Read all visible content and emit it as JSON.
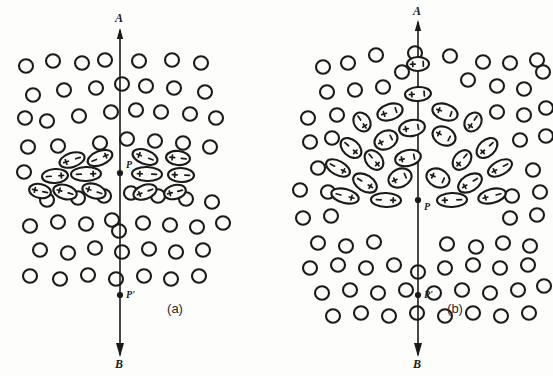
{
  "figure": {
    "background_color": "#fdfdfb",
    "ink_color": "#1a1a1a",
    "width": 553,
    "height": 376
  },
  "panels": [
    {
      "id": "a",
      "caption": "(a)",
      "caption_x": 175,
      "caption_y": 313,
      "axis": {
        "x": 120,
        "top_y": 30,
        "bottom_y": 355,
        "top_label": "A",
        "top_label_x": 119,
        "top_label_y": 22,
        "bottom_label": "B",
        "bottom_label_x": 119,
        "bottom_label_y": 368
      },
      "points": [
        {
          "name": "P",
          "label": "P",
          "x": 120,
          "y": 173,
          "label_x": 126,
          "label_y": 168
        },
        {
          "name": "P'",
          "label": "P'",
          "x": 120,
          "y": 295,
          "label_x": 126,
          "label_y": 298
        }
      ],
      "circle_radius": 7,
      "circles": [
        [
          26,
          66
        ],
        [
          53,
          61
        ],
        [
          82,
          63
        ],
        [
          105,
          60
        ],
        [
          139,
          61
        ],
        [
          172,
          60
        ],
        [
          201,
          63
        ],
        [
          33,
          95
        ],
        [
          64,
          90
        ],
        [
          96,
          88
        ],
        [
          122,
          84
        ],
        [
          146,
          86
        ],
        [
          174,
          88
        ],
        [
          205,
          92
        ],
        [
          47,
          121
        ],
        [
          79,
          116
        ],
        [
          111,
          112
        ],
        [
          136,
          110
        ],
        [
          161,
          112
        ],
        [
          190,
          114
        ],
        [
          216,
          118
        ],
        [
          25,
          118
        ],
        [
          28,
          147
        ],
        [
          58,
          146
        ],
        [
          100,
          143
        ],
        [
          127,
          139
        ],
        [
          155,
          141
        ],
        [
          183,
          143
        ],
        [
          210,
          147
        ],
        [
          24,
          172
        ],
        [
          47,
          200
        ],
        [
          78,
          198
        ],
        [
          104,
          196
        ],
        [
          131,
          193
        ],
        [
          158,
          196
        ],
        [
          186,
          199
        ],
        [
          212,
          202
        ],
        [
          30,
          226
        ],
        [
          58,
          222
        ],
        [
          86,
          224
        ],
        [
          112,
          220
        ],
        [
          119,
          231
        ],
        [
          143,
          223
        ],
        [
          170,
          225
        ],
        [
          197,
          227
        ],
        [
          223,
          223
        ],
        [
          40,
          250
        ],
        [
          68,
          253
        ],
        [
          95,
          248
        ],
        [
          122,
          252
        ],
        [
          149,
          249
        ],
        [
          176,
          252
        ],
        [
          203,
          250
        ],
        [
          30,
          276
        ],
        [
          60,
          279
        ],
        [
          88,
          275
        ],
        [
          116,
          279
        ],
        [
          144,
          276
        ],
        [
          171,
          279
        ],
        [
          199,
          276
        ]
      ],
      "dipoles": [
        {
          "cx": 72,
          "cy": 160,
          "rx": 13,
          "ry": 7,
          "angle": -18,
          "left_sign": "+",
          "right_sign": "-"
        },
        {
          "cx": 100,
          "cy": 158,
          "rx": 13,
          "ry": 7,
          "angle": -22,
          "left_sign": "-",
          "right_sign": "+"
        },
        {
          "cx": 55,
          "cy": 176,
          "rx": 13,
          "ry": 7,
          "angle": -4,
          "left_sign": "-",
          "right_sign": "+"
        },
        {
          "cx": 86,
          "cy": 174,
          "rx": 15,
          "ry": 7,
          "angle": -2,
          "left_sign": "-",
          "right_sign": "+"
        },
        {
          "cx": 65,
          "cy": 192,
          "rx": 12,
          "ry": 7,
          "angle": 16,
          "left_sign": "+",
          "right_sign": "-"
        },
        {
          "cx": 94,
          "cy": 191,
          "rx": 12,
          "ry": 7,
          "angle": 18,
          "left_sign": "+",
          "right_sign": "-"
        },
        {
          "cx": 40,
          "cy": 191,
          "rx": 11,
          "ry": 7,
          "angle": 12,
          "left_sign": "+",
          "right_sign": "-"
        },
        {
          "cx": 145,
          "cy": 157,
          "rx": 13,
          "ry": 7,
          "angle": 20,
          "left_sign": "+",
          "right_sign": "-"
        },
        {
          "cx": 178,
          "cy": 158,
          "rx": 12,
          "ry": 7,
          "angle": 6,
          "left_sign": "+",
          "right_sign": "-"
        },
        {
          "cx": 147,
          "cy": 174,
          "rx": 15,
          "ry": 7,
          "angle": 2,
          "left_sign": "+",
          "right_sign": "-"
        },
        {
          "cx": 181,
          "cy": 175,
          "rx": 13,
          "ry": 7,
          "angle": 2,
          "left_sign": "+",
          "right_sign": "-"
        },
        {
          "cx": 145,
          "cy": 192,
          "rx": 12,
          "ry": 7,
          "angle": -20,
          "left_sign": "+",
          "right_sign": "-"
        },
        {
          "cx": 175,
          "cy": 192,
          "rx": 11,
          "ry": 7,
          "angle": -14,
          "left_sign": "+",
          "right_sign": "-"
        }
      ]
    },
    {
      "id": "b",
      "caption": "(b)",
      "caption_x": 455,
      "caption_y": 313,
      "axis": {
        "x": 418,
        "top_y": 22,
        "bottom_y": 355,
        "top_label": "A",
        "top_label_x": 417,
        "top_label_y": 15,
        "bottom_label": "B",
        "bottom_label_x": 417,
        "bottom_label_y": 368
      },
      "points": [
        {
          "name": "P",
          "label": "P",
          "x": 418,
          "y": 200,
          "label_x": 424,
          "label_y": 210
        },
        {
          "name": "P'",
          "label": "P'",
          "x": 418,
          "y": 295,
          "label_x": 424,
          "label_y": 298
        }
      ],
      "circle_radius": 7,
      "circles": [
        [
          376,
          55
        ],
        [
          415,
          53
        ],
        [
          450,
          56
        ],
        [
          323,
          67
        ],
        [
          348,
          63
        ],
        [
          402,
          72
        ],
        [
          483,
          62
        ],
        [
          510,
          63
        ],
        [
          537,
          60
        ],
        [
          327,
          92
        ],
        [
          355,
          90
        ],
        [
          383,
          87
        ],
        [
          468,
          80
        ],
        [
          497,
          86
        ],
        [
          524,
          89
        ],
        [
          543,
          72
        ],
        [
          308,
          118
        ],
        [
          337,
          115
        ],
        [
          497,
          112
        ],
        [
          524,
          115
        ],
        [
          546,
          108
        ],
        [
          310,
          142
        ],
        [
          332,
          138
        ],
        [
          520,
          140
        ],
        [
          546,
          136
        ],
        [
          318,
          168
        ],
        [
          300,
          190
        ],
        [
          328,
          192
        ],
        [
          533,
          170
        ],
        [
          512,
          196
        ],
        [
          540,
          192
        ],
        [
          303,
          218
        ],
        [
          331,
          216
        ],
        [
          510,
          218
        ],
        [
          537,
          215
        ],
        [
          318,
          243
        ],
        [
          346,
          246
        ],
        [
          374,
          242
        ],
        [
          447,
          244
        ],
        [
          476,
          247
        ],
        [
          503,
          243
        ],
        [
          530,
          246
        ],
        [
          310,
          268
        ],
        [
          338,
          265
        ],
        [
          366,
          268
        ],
        [
          394,
          265
        ],
        [
          418,
          272
        ],
        [
          445,
          268
        ],
        [
          473,
          265
        ],
        [
          500,
          268
        ],
        [
          528,
          265
        ],
        [
          322,
          293
        ],
        [
          350,
          290
        ],
        [
          378,
          293
        ],
        [
          406,
          290
        ],
        [
          434,
          293
        ],
        [
          462,
          290
        ],
        [
          490,
          293
        ],
        [
          518,
          290
        ],
        [
          544,
          286
        ],
        [
          333,
          316
        ],
        [
          361,
          313
        ],
        [
          389,
          316
        ],
        [
          417,
          313
        ],
        [
          445,
          316
        ],
        [
          473,
          313
        ],
        [
          501,
          316
        ],
        [
          529,
          313
        ]
      ],
      "dipoles": [
        {
          "cx": 418,
          "cy": 94,
          "rx": 7,
          "ry": 13,
          "angle": 86,
          "left_sign": "-",
          "right_sign": "+"
        },
        {
          "cx": 390,
          "cy": 112,
          "rx": 8,
          "ry": 13,
          "angle": 72,
          "left_sign": "-",
          "right_sign": "+"
        },
        {
          "cx": 445,
          "cy": 112,
          "rx": 8,
          "ry": 13,
          "angle": -72,
          "left_sign": "+",
          "right_sign": "-"
        },
        {
          "cx": 362,
          "cy": 122,
          "rx": 10,
          "ry": 8,
          "angle": 56,
          "left_sign": "-",
          "right_sign": "+"
        },
        {
          "cx": 473,
          "cy": 122,
          "rx": 10,
          "ry": 8,
          "angle": -56,
          "left_sign": "+",
          "right_sign": "-"
        },
        {
          "cx": 412,
          "cy": 128,
          "rx": 8,
          "ry": 13,
          "angle": 80,
          "left_sign": "-",
          "right_sign": "+"
        },
        {
          "cx": 444,
          "cy": 136,
          "rx": 9,
          "ry": 12,
          "angle": -64,
          "left_sign": "+",
          "right_sign": "-"
        },
        {
          "cx": 386,
          "cy": 140,
          "rx": 9,
          "ry": 12,
          "angle": 64,
          "left_sign": "-",
          "right_sign": "+"
        },
        {
          "cx": 351,
          "cy": 148,
          "rx": 12,
          "ry": 8,
          "angle": 42,
          "left_sign": "-",
          "right_sign": "+"
        },
        {
          "cx": 487,
          "cy": 148,
          "rx": 12,
          "ry": 8,
          "angle": -42,
          "left_sign": "+",
          "right_sign": "-"
        },
        {
          "cx": 338,
          "cy": 168,
          "rx": 13,
          "ry": 7,
          "angle": 28,
          "left_sign": "-",
          "right_sign": "+"
        },
        {
          "cx": 500,
          "cy": 168,
          "rx": 13,
          "ry": 7,
          "angle": -28,
          "left_sign": "+",
          "right_sign": "-"
        },
        {
          "cx": 374,
          "cy": 160,
          "rx": 11,
          "ry": 8,
          "angle": 50,
          "left_sign": "-",
          "right_sign": "+"
        },
        {
          "cx": 462,
          "cy": 160,
          "rx": 11,
          "ry": 8,
          "angle": -50,
          "left_sign": "+",
          "right_sign": "-"
        },
        {
          "cx": 408,
          "cy": 158,
          "rx": 8,
          "ry": 13,
          "angle": 78,
          "left_sign": "-",
          "right_sign": "+"
        },
        {
          "cx": 365,
          "cy": 183,
          "rx": 13,
          "ry": 8,
          "angle": 32,
          "left_sign": "-",
          "right_sign": "+"
        },
        {
          "cx": 470,
          "cy": 183,
          "rx": 13,
          "ry": 8,
          "angle": -32,
          "left_sign": "+",
          "right_sign": "-"
        },
        {
          "cx": 400,
          "cy": 178,
          "rx": 9,
          "ry": 12,
          "angle": 66,
          "left_sign": "-",
          "right_sign": "+"
        },
        {
          "cx": 438,
          "cy": 178,
          "rx": 9,
          "ry": 12,
          "angle": -66,
          "left_sign": "+",
          "right_sign": "-"
        },
        {
          "cx": 345,
          "cy": 196,
          "rx": 14,
          "ry": 7,
          "angle": 14,
          "left_sign": "-",
          "right_sign": "+"
        },
        {
          "cx": 492,
          "cy": 196,
          "rx": 14,
          "ry": 7,
          "angle": -14,
          "left_sign": "+",
          "right_sign": "-"
        },
        {
          "cx": 386,
          "cy": 200,
          "rx": 15,
          "ry": 7,
          "angle": 2,
          "left_sign": "-",
          "right_sign": "+"
        },
        {
          "cx": 452,
          "cy": 200,
          "rx": 15,
          "ry": 7,
          "angle": -2,
          "left_sign": "+",
          "right_sign": "-"
        },
        {
          "cx": 418,
          "cy": 64,
          "rx": 7,
          "ry": 11,
          "angle": 88,
          "left_sign": "-",
          "right_sign": "+"
        }
      ]
    }
  ]
}
